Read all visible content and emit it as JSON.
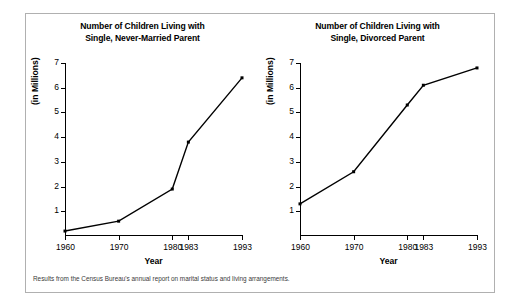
{
  "figure": {
    "footnote": "Results from the Census Bureau's annual report on marital status and living arrangements.",
    "frame_color": "#b0b0b0",
    "background": "#ffffff",
    "line_color": "#000000"
  },
  "chart_data": [
    {
      "type": "line",
      "title": "Number of Children Living with Single, Never-Married Parent",
      "title_line1": "Number of Children Living with",
      "title_line2": "Single, Never-Married Parent",
      "xlabel": "Year",
      "ylabel": "(in Millions)",
      "categories": [
        "1960",
        "1970",
        "1980",
        "1983",
        "1993"
      ],
      "x": [
        1960,
        1970,
        1980,
        1983,
        1993
      ],
      "values": [
        0.2,
        0.6,
        1.9,
        3.8,
        6.4
      ],
      "ylim": [
        0,
        7
      ],
      "yticks": [
        1,
        2,
        3,
        4,
        5,
        6,
        7
      ],
      "xlim": [
        1960,
        1993
      ],
      "grid": false,
      "legend": "none",
      "marker": "square"
    },
    {
      "type": "line",
      "title": "Number of Children Living with Single, Divorced Parent",
      "title_line1": "Number of Children Living with",
      "title_line2": "Single, Divorced Parent",
      "xlabel": "Year",
      "ylabel": "(in Millions)",
      "categories": [
        "1960",
        "1970",
        "1980",
        "1983",
        "1993"
      ],
      "x": [
        1960,
        1970,
        1980,
        1983,
        1993
      ],
      "values": [
        1.3,
        2.6,
        5.3,
        6.1,
        6.8
      ],
      "ylim": [
        0,
        7
      ],
      "yticks": [
        1,
        2,
        3,
        4,
        5,
        6,
        7
      ],
      "xlim": [
        1960,
        1993
      ],
      "grid": false,
      "legend": "none",
      "marker": "square"
    }
  ]
}
